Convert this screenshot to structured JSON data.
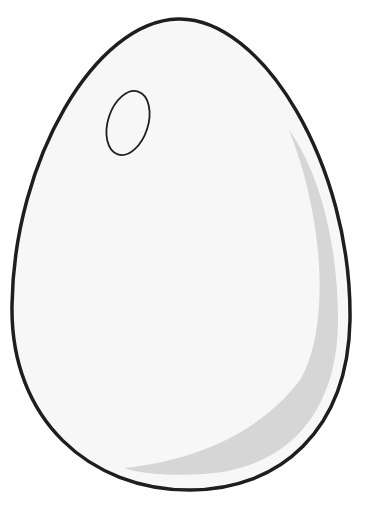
{
  "illustration": {
    "subject": "egg",
    "colors": {
      "background": "#ffffff",
      "shell": "#f7f7f7",
      "outline": "#1e1e1e",
      "shadow": "#d6d6d6",
      "highlight_outline": "#1e1e1e"
    }
  }
}
